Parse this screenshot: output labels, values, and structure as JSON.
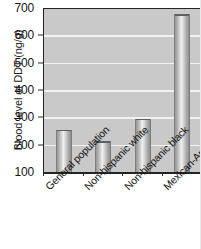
{
  "chart_data": {
    "type": "bar",
    "title": "",
    "subtitle": "",
    "xlabel": "",
    "ylabel": "Blood level of DDT (ng/g)",
    "categories": [
      "General population",
      "Non-hispanic white",
      "Non-hispanic black",
      "Mexican-American"
    ],
    "values": [
      255,
      212,
      295,
      678
    ],
    "ylim": [
      100,
      700
    ],
    "yticks": [
      100,
      200,
      300,
      400,
      500,
      600,
      700
    ],
    "ytick_labels": [
      "100",
      "200",
      "300",
      "400",
      "500",
      "600",
      "700"
    ],
    "grid": "horizontal",
    "legend": "none",
    "annotations": [],
    "series": [
      {
        "name": "Blood level of DDT",
        "values": [
          255,
          212,
          295,
          678
        ]
      }
    ]
  },
  "style": {
    "plot_background": "#c9c9c9",
    "gridline_color": "#f2f2f2",
    "axis_color": "#242424",
    "bar_fill": "#c0c0c0",
    "text_color": "#141414",
    "page_background": "#ffffff"
  }
}
